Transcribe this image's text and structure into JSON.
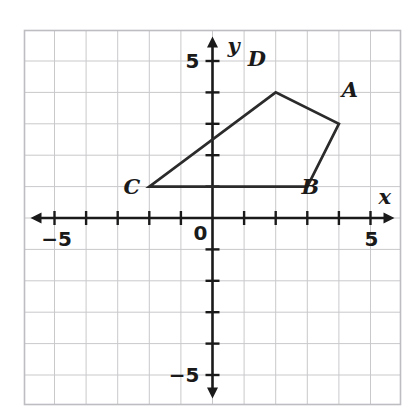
{
  "figure": {
    "background_color": "#ffffff",
    "grid_color": "#c9c9cc",
    "axis_color": "#1a1a1a",
    "shape_color": "#2b2b2b"
  },
  "chart_data": {
    "type": "scatter",
    "title": "",
    "xlabel": "x",
    "ylabel": "y",
    "xlim": [
      -6,
      6
    ],
    "ylim": [
      -6,
      6
    ],
    "grid": true,
    "legend": "none",
    "x_tick_labels": [
      {
        "value": -5,
        "text": "−5"
      },
      {
        "value": 5,
        "text": "5"
      }
    ],
    "y_tick_labels": [
      {
        "value": 5,
        "text": "5"
      },
      {
        "value": -5,
        "text": "−5"
      }
    ],
    "origin_label": "0",
    "x_ticks": [
      -6,
      -5,
      -4,
      -3,
      -2,
      -1,
      1,
      2,
      3,
      4,
      5,
      6
    ],
    "y_ticks": [
      -6,
      -5,
      -4,
      -3,
      -2,
      -1,
      1,
      2,
      3,
      4,
      5,
      6
    ],
    "shapes": [
      {
        "name": "quadrilateral-abcd",
        "closed": true,
        "vertices": [
          {
            "label": "A",
            "x": 4,
            "y": 3,
            "label_dx": 0.35,
            "label_dy": 0.85
          },
          {
            "label": "B",
            "x": 3,
            "y": 1,
            "label_dx": 0.1,
            "label_dy": -0.25
          },
          {
            "label": "C",
            "x": -2,
            "y": 1,
            "label_dx": -0.55,
            "label_dy": -0.25
          },
          {
            "label": "D",
            "x": 2,
            "y": 4,
            "label_dx": -0.6,
            "label_dy": 0.85
          }
        ]
      }
    ]
  },
  "labels": {
    "x_axis": "x",
    "y_axis": "y",
    "x_neg_five": "−5",
    "x_pos_five": "5",
    "y_pos_five": "5",
    "y_neg_five": "−5",
    "origin": "0",
    "vertex_a": "A",
    "vertex_b": "B",
    "vertex_c": "C",
    "vertex_d": "D"
  }
}
